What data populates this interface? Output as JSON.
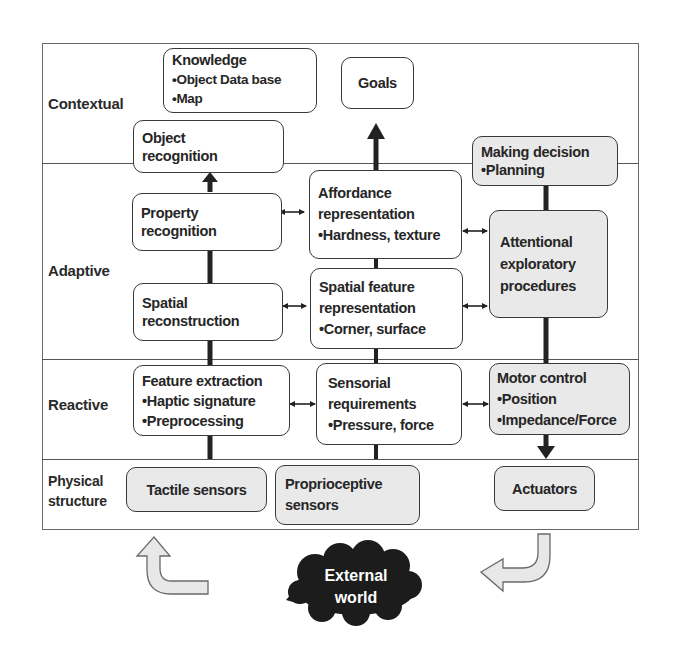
{
  "layers": [
    {
      "id": "contextual",
      "label_lines": [
        "Contextual"
      ]
    },
    {
      "id": "adaptive",
      "label_lines": [
        "Adaptive"
      ]
    },
    {
      "id": "reactive",
      "label_lines": [
        "Reactive"
      ]
    },
    {
      "id": "physical",
      "label_lines": [
        "Physical",
        "structure"
      ]
    }
  ],
  "boxes": {
    "knowledge": {
      "lines": [
        "Knowledge",
        "•Object Data base",
        "•Map"
      ]
    },
    "goals": {
      "lines": [
        "Goals"
      ]
    },
    "object_recognition": {
      "lines": [
        "Object",
        "recognition"
      ]
    },
    "making_decision": {
      "lines": [
        "Making decision",
        "•Planning"
      ]
    },
    "property_recognition": {
      "lines": [
        "Property",
        "recognition"
      ]
    },
    "affordance_representation": {
      "lines": [
        "Affordance",
        "representation",
        "•Hardness, texture"
      ]
    },
    "attentional_exploratory": {
      "lines": [
        "Attentional",
        "exploratory",
        "procedures"
      ]
    },
    "spatial_reconstruction": {
      "lines": [
        "Spatial",
        "reconstruction"
      ]
    },
    "spatial_feature_representation": {
      "lines": [
        "Spatial feature",
        "representation",
        "•Corner, surface"
      ]
    },
    "feature_extraction": {
      "lines": [
        "Feature extraction",
        "•Haptic signature",
        "•Preprocessing"
      ]
    },
    "sensorial_requirements": {
      "lines": [
        "Sensorial",
        "requirements",
        "•Pressure, force"
      ]
    },
    "motor_control": {
      "lines": [
        "Motor control",
        "•Position",
        "•Impedance/Force"
      ]
    },
    "tactile_sensors": {
      "lines": [
        "Tactile sensors"
      ]
    },
    "proprioceptive_sensors": {
      "lines": [
        "Proprioceptive",
        "sensors"
      ]
    },
    "actuators": {
      "lines": [
        "Actuators"
      ]
    }
  },
  "external_world": {
    "lines": [
      "External",
      "world"
    ]
  },
  "colors": {
    "box_border": "#3a3a3a",
    "box_fill_white": "#ffffff",
    "box_fill_gray": "#e9e9e9",
    "cloud_fill": "#1c1c1c",
    "arrow_fill": "#e6e6e6",
    "connector": "#222222"
  }
}
